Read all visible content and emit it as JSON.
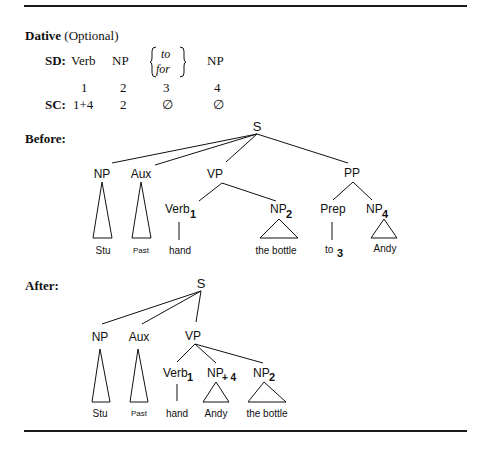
{
  "rule": {
    "name": "Dative",
    "qualifier": "(Optional)",
    "sd_label": "SD:",
    "sc_label": "SC:",
    "sd_terms": [
      "Verb",
      "NP",
      "to",
      "for",
      "NP"
    ],
    "indices": [
      "1",
      "2",
      "3",
      "4"
    ],
    "sc_values": [
      "1+4",
      "2",
      "∅",
      "∅"
    ]
  },
  "before": {
    "label": "Before:",
    "root": "S",
    "nodes": {
      "np": "NP",
      "aux": "Aux",
      "vp": "VP",
      "pp": "PP",
      "verb": "Verb",
      "verb_sub": "1",
      "np2": "NP",
      "np2_sub": "2",
      "prep": "Prep",
      "np4": "NP",
      "np4_sub": "4"
    },
    "leaves": {
      "stu": "Stu",
      "past": "Past",
      "hand": "hand",
      "bottle": "the bottle",
      "to": "to",
      "to_sub": "3",
      "andy": "Andy"
    }
  },
  "after": {
    "label": "After:",
    "root": "S",
    "nodes": {
      "np": "NP",
      "aux": "Aux",
      "vp": "VP",
      "verb": "Verb",
      "verb_sub": "1",
      "np4": "NP",
      "np4_sub": "+ 4",
      "np2": "NP",
      "np2_sub": "2"
    },
    "leaves": {
      "stu": "Stu",
      "past": "Past",
      "hand": "hand",
      "andy": "Andy",
      "bottle": "the bottle"
    }
  }
}
